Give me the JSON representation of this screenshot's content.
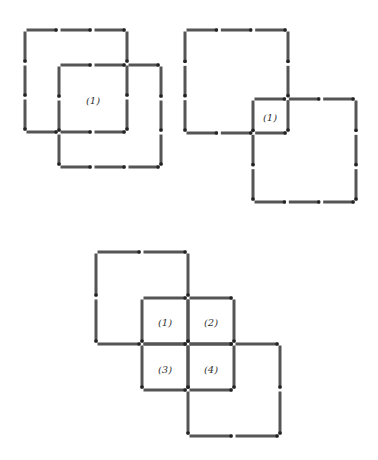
{
  "figures": [
    {
      "name": "figure-1",
      "description": "Two overlapping 3x3-match squares sharing one inner square",
      "squares": [
        {
          "x": 25,
          "y": 30,
          "size": 102,
          "matches_per_side": 3
        },
        {
          "x": 59,
          "y": 65,
          "size": 102,
          "matches_per_side": 3
        }
      ],
      "labels": [
        {
          "text": "(1)",
          "x": 93,
          "y": 100
        }
      ]
    },
    {
      "name": "figure-2",
      "description": "Two 3x3-match squares overlapping at a corner forming one small square",
      "squares": [
        {
          "x": 185,
          "y": 30,
          "size": 103,
          "matches_per_side": 3
        },
        {
          "x": 253,
          "y": 99,
          "size": 103,
          "matches_per_side": 3
        }
      ],
      "labels": [
        {
          "text": "(1)",
          "x": 270,
          "y": 117
        }
      ]
    },
    {
      "name": "figure-3",
      "description": "Two large 2x2-match squares and a 2x2 grid of small squares",
      "squares": [
        {
          "x": 96,
          "y": 252,
          "size": 92,
          "matches_per_side": 2
        },
        {
          "x": 188,
          "y": 344,
          "size": 92,
          "matches_per_side": 2
        }
      ],
      "grid": {
        "x": 142,
        "y": 298,
        "cell": 46,
        "rows": 2,
        "cols": 2
      },
      "labels": [
        {
          "text": "(1)",
          "x": 165,
          "y": 322
        },
        {
          "text": "(2)",
          "x": 211,
          "y": 322
        },
        {
          "text": "(3)",
          "x": 165,
          "y": 369
        },
        {
          "text": "(4)",
          "x": 211,
          "y": 369
        }
      ]
    }
  ],
  "colors": {
    "match": "#555555",
    "background": "#ffffff"
  }
}
